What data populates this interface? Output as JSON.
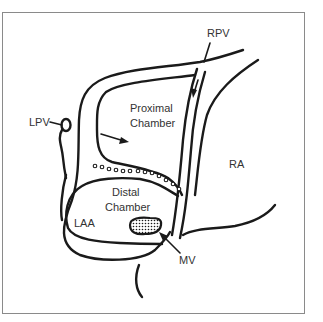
{
  "diagram": {
    "type": "anatomical-line-drawing",
    "labels": {
      "rpv": "RPV",
      "lpv": "LPV",
      "proximal_line1": "Proximal",
      "proximal_line2": "Chamber",
      "distal_line1": "Distal",
      "distal_line2": "Chamber",
      "laa": "LAA",
      "ra": "RA",
      "mv": "MV"
    },
    "colors": {
      "stroke": "#1a1a1a",
      "label": "#333333",
      "frame": "#8a8a8a",
      "background": "#ffffff"
    }
  }
}
